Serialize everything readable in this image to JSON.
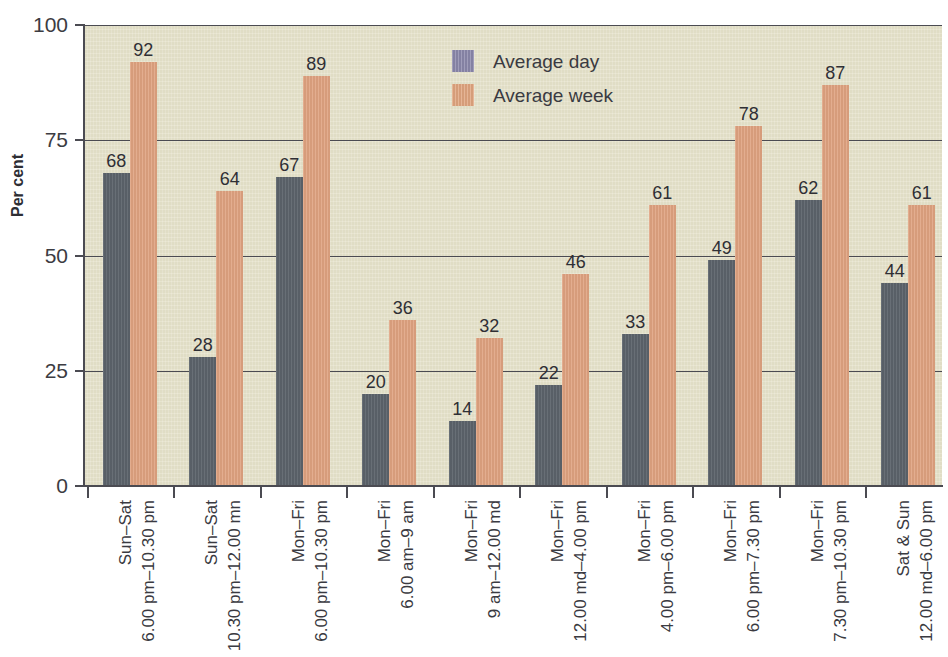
{
  "chart_data": {
    "type": "bar",
    "title": "",
    "xlabel": "",
    "ylabel": "Per cent",
    "ylim": [
      0,
      100
    ],
    "yticks": [
      0,
      25,
      50,
      75,
      100
    ],
    "grid": "horizontal",
    "legend_position": "top-center",
    "categories": [
      {
        "line1": "Sun–Sat",
        "line2": "6.00 pm–10.30 pm"
      },
      {
        "line1": "Sun–Sat",
        "line2": "10.30 pm–12.00 mn"
      },
      {
        "line1": "Mon–Fri",
        "line2": "6.00 pm–10.30 pm"
      },
      {
        "line1": "Mon–Fri",
        "line2": "6.00 am–9 am"
      },
      {
        "line1": "Mon–Fri",
        "line2": "9 am–12.00 md"
      },
      {
        "line1": "Mon–Fri",
        "line2": "12.00 md–4.00 pm"
      },
      {
        "line1": "Mon–Fri",
        "line2": "4.00 pm–6.00 pm"
      },
      {
        "line1": "Mon–Fri",
        "line2": "6.00 pm–7.30 pm"
      },
      {
        "line1": "Mon–Fri",
        "line2": "7.30 pm–10.30 pm"
      },
      {
        "line1": "Sat & Sun",
        "line2": "12.00 md–6.00 pm"
      }
    ],
    "series": [
      {
        "name": "Average day",
        "color": "#5d646c",
        "legend_color": "#8b88ab",
        "values": [
          68,
          28,
          67,
          20,
          14,
          22,
          33,
          49,
          62,
          44
        ]
      },
      {
        "name": "Average week",
        "color": "#dfa280",
        "legend_color": "#e0a57f",
        "values": [
          92,
          64,
          89,
          36,
          32,
          46,
          61,
          78,
          87,
          61
        ]
      }
    ]
  },
  "colors": {
    "plot_background": "#e4e1c9",
    "page_background": "#ffffff",
    "axis": "#4b4b52",
    "text": "#3a3a41",
    "bar_day": "#5d646c",
    "bar_week": "#dfa280",
    "legend_day": "#8b88ab",
    "legend_week": "#e0a57f"
  },
  "axis_labels": {
    "y_title": "Per cent",
    "y_ticks": [
      "100",
      "75",
      "50",
      "25",
      "0"
    ]
  },
  "legend": {
    "entries": [
      {
        "label": "Average day",
        "key": "day"
      },
      {
        "label": "Average week",
        "key": "week"
      }
    ]
  }
}
